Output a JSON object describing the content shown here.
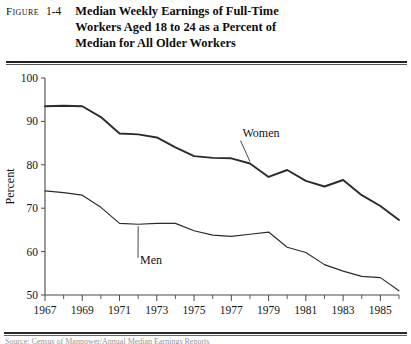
{
  "figure": {
    "label": "Figure",
    "number": "1-4",
    "title_line1": "Median Weekly Earnings of Full-Time",
    "title_line2": "Workers Aged 18 to 24 as a Percent of",
    "title_line3": "Median for All Older Workers",
    "source_note": "Source: Census of Manpower/Annual Median Earnings Reports"
  },
  "chart_data": {
    "type": "line",
    "title": "Median Weekly Earnings of Full-Time Workers Aged 18 to 24 as a Percent of Median for All Older Workers",
    "xlabel": "Year",
    "ylabel": "Percent",
    "xlim": [
      1967,
      1986
    ],
    "ylim": [
      50,
      100
    ],
    "ytick_values": [
      50,
      60,
      70,
      80,
      90,
      100
    ],
    "ytick_labels": [
      "50",
      "60",
      "70",
      "80",
      "90",
      "100"
    ],
    "xtick_values": [
      1967,
      1968,
      1969,
      1970,
      1971,
      1972,
      1973,
      1974,
      1975,
      1976,
      1977,
      1978,
      1979,
      1980,
      1981,
      1982,
      1983,
      1984,
      1985,
      1986
    ],
    "xtick_labels_shown": [
      "1967",
      "1969",
      "1971",
      "1973",
      "1975",
      "1977",
      "1979",
      "1981",
      "1983",
      "1985"
    ],
    "xtick_labels_shown_values": [
      1967,
      1969,
      1971,
      1973,
      1975,
      1977,
      1979,
      1981,
      1983,
      1985
    ],
    "grid": false,
    "legend_position": "inline-annotation",
    "x": [
      1967,
      1968,
      1969,
      1970,
      1971,
      1972,
      1973,
      1974,
      1975,
      1976,
      1977,
      1978,
      1979,
      1980,
      1981,
      1982,
      1983,
      1984,
      1985,
      1986
    ],
    "series": [
      {
        "name": "Women",
        "label": "Women",
        "values": [
          93.5,
          93.6,
          93.5,
          91.0,
          87.2,
          87.0,
          86.3,
          84.0,
          82.0,
          81.6,
          81.5,
          80.3,
          77.2,
          78.8,
          76.3,
          75.0,
          76.5,
          73.0,
          70.5,
          67.3
        ]
      },
      {
        "name": "Men",
        "label": "Men",
        "values": [
          74.0,
          73.6,
          73.0,
          70.2,
          66.5,
          66.3,
          66.5,
          66.5,
          64.8,
          63.8,
          63.5,
          64.0,
          64.5,
          61.0,
          59.8,
          57.0,
          55.5,
          54.3,
          54.0,
          51.0
        ]
      }
    ],
    "annotations": [
      {
        "text": "Women",
        "x_value": 1977.6,
        "y_value": 86.5
      },
      {
        "text": "Men",
        "x_value": 1972.1,
        "y_value": 57.2
      }
    ]
  }
}
